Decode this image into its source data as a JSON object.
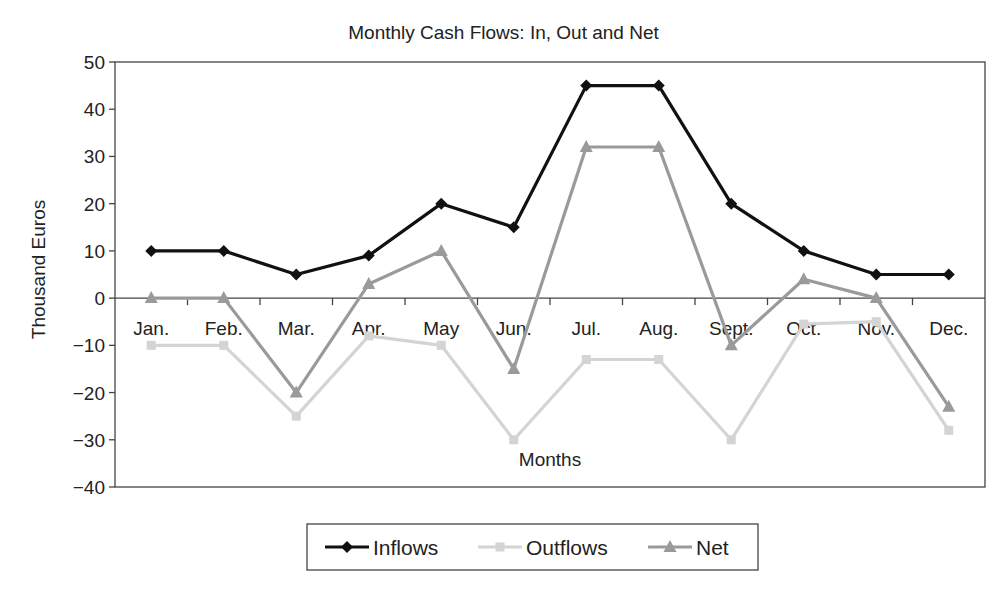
{
  "chart_data": {
    "type": "line",
    "title": "Monthly Cash Flows: In, Out and Net",
    "xlabel": "Months",
    "ylabel": "Thousand Euros",
    "ylim": [
      -40,
      50
    ],
    "yticks": [
      50,
      40,
      30,
      20,
      10,
      0,
      -10,
      -20,
      -30,
      -40
    ],
    "grid": false,
    "legend_position": "bottom",
    "categories": [
      "Jan.",
      "Feb.",
      "Mar.",
      "Apr.",
      "May",
      "Jun.",
      "Jul.",
      "Aug.",
      "Sept.",
      "Oct.",
      "Nov.",
      "Dec."
    ],
    "series": [
      {
        "name": "Inflows",
        "color": "#111111",
        "marker": "diamond",
        "values": [
          10,
          10,
          5,
          9,
          20,
          15,
          45,
          45,
          20,
          10,
          5,
          5
        ]
      },
      {
        "name": "Outflows",
        "color": "#d4d4d4",
        "marker": "square",
        "values": [
          -10,
          -10,
          -25,
          -8,
          -10,
          -30,
          -13,
          -13,
          -30,
          -5.5,
          -5,
          -28
        ]
      },
      {
        "name": "Net",
        "color": "#9a9a9a",
        "marker": "triangle",
        "values": [
          0,
          0,
          -20,
          3,
          10,
          -15,
          32,
          32,
          -10,
          4,
          0,
          -23
        ]
      }
    ]
  }
}
